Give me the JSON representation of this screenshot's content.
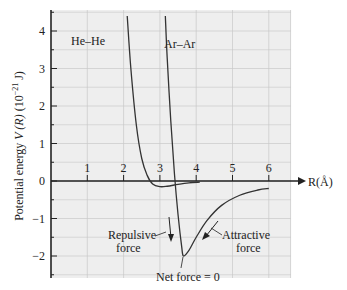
{
  "chart_data": {
    "type": "line",
    "title": "",
    "xlabel": "R(Å)",
    "ylabel": "Potential energy V (R) (10^-21 J)",
    "ylabel_parts": {
      "main": "Potential energy ",
      "var": "V (R)",
      "unit_open": " (10",
      "exp": "−21",
      "unit_close": " J)"
    },
    "xlim": [
      0,
      6.2
    ],
    "ylim": [
      -2.6,
      4.4
    ],
    "x_ticks": [
      1,
      2,
      3,
      4,
      5,
      6
    ],
    "x_tick_labels": [
      "1",
      "2",
      "3",
      "4",
      "5",
      "6"
    ],
    "y_ticks": [
      -2,
      -1,
      0,
      1,
      2,
      3,
      4
    ],
    "y_tick_labels": [
      "−2",
      "−1",
      "0",
      "1",
      "2",
      "3",
      "4"
    ],
    "grid": true,
    "series": [
      {
        "name": "He–He",
        "x": [
          2.1,
          2.2,
          2.35,
          2.5,
          2.65,
          2.8,
          3.0,
          3.2,
          3.5,
          3.8,
          4.1
        ],
        "y": [
          4.4,
          3.0,
          1.5,
          0.6,
          0.15,
          -0.08,
          -0.15,
          -0.14,
          -0.09,
          -0.05,
          -0.03
        ]
      },
      {
        "name": "Ar–Ar",
        "x": [
          3.15,
          3.2,
          3.3,
          3.4,
          3.5,
          3.6,
          3.65,
          3.8,
          4.0,
          4.3,
          4.7,
          5.2,
          5.7,
          6.0
        ],
        "y": [
          4.4,
          3.3,
          1.6,
          0.2,
          -0.9,
          -1.75,
          -2.0,
          -1.85,
          -1.5,
          -1.05,
          -0.65,
          -0.38,
          -0.24,
          -0.2
        ]
      }
    ],
    "annotations": [
      {
        "text": "He–He",
        "x": 1.3,
        "y": 3.0
      },
      {
        "text": "Ar–Ar",
        "x": 3.3,
        "y": 3.0
      },
      {
        "text": "Repulsive",
        "x": 2.1,
        "y": -1.55
      },
      {
        "text": "force",
        "x": 2.1,
        "y": -1.85
      },
      {
        "text": "Attractive",
        "x": 4.95,
        "y": -1.55
      },
      {
        "text": "force",
        "x": 4.95,
        "y": -1.85
      },
      {
        "text": "Net force = 0",
        "x": 3.6,
        "y": -2.55
      }
    ]
  },
  "labels": {
    "he": "He–He",
    "ar": "Ar–Ar",
    "repulsive1": "Repulsive",
    "repulsive2": "force",
    "attractive1": "Attractive",
    "attractive2": "force",
    "net": "Net force = 0",
    "xaxis": "R(Å)"
  },
  "colors": {
    "plot_bg": "#eeeeee",
    "grid": "#c8c8c8",
    "axis": "#222222",
    "curve": "#333333"
  }
}
